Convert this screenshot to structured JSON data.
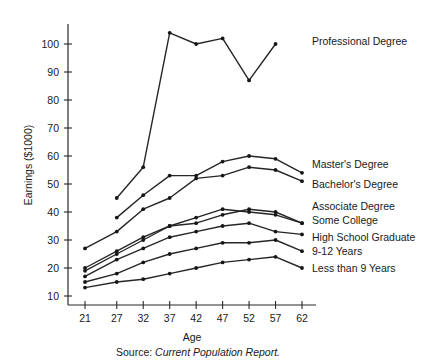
{
  "chart_data": {
    "type": "line",
    "title": "",
    "xlabel": "Age",
    "ylabel": "Earnings ($1000)",
    "x": [
      21,
      27,
      32,
      37,
      42,
      47,
      52,
      57,
      62
    ],
    "xticklabels": [
      "21",
      "27",
      "32",
      "37",
      "42",
      "47",
      "52",
      "57",
      "62"
    ],
    "yticklabels": [
      "10",
      "20",
      "30",
      "40",
      "50",
      "60",
      "70",
      "80",
      "90",
      "100"
    ],
    "yticks": [
      10,
      20,
      30,
      40,
      50,
      60,
      70,
      80,
      90,
      100
    ],
    "xlim": [
      21,
      62
    ],
    "ylim": [
      5,
      108
    ],
    "grid": false,
    "legend_position": "right-inline-at-series-end",
    "annotation": "Source: Current Population Report.",
    "annotation_prefix": "Source: ",
    "annotation_italic": "Current Population Report.",
    "series": [
      {
        "name": "Professional Degree",
        "x": [
          27,
          32,
          37,
          42,
          47,
          52,
          57
        ],
        "values": [
          45,
          56,
          104,
          100,
          102,
          87,
          100
        ],
        "label_x": 62,
        "label_y": 101
      },
      {
        "name": "Master's Degree",
        "x": [
          27,
          32,
          37,
          42,
          47,
          52,
          57,
          62
        ],
        "values": [
          38,
          46,
          53,
          53,
          58,
          60,
          59,
          54
        ],
        "label_x": 62,
        "label_y": 57
      },
      {
        "name": "Bachelor's Degree",
        "x": [
          21,
          27,
          32,
          37,
          42,
          47,
          52,
          57,
          62
        ],
        "values": [
          27,
          33,
          41,
          45,
          52,
          53,
          56,
          55,
          51
        ],
        "label_x": 62,
        "label_y": 50
      },
      {
        "name": "Associate Degree",
        "x": [
          21,
          27,
          32,
          37,
          42,
          47,
          52,
          57,
          62
        ],
        "values": [
          20,
          26,
          31,
          35,
          38,
          41,
          40,
          39,
          36
        ],
        "label_x": 62,
        "label_y": 42
      },
      {
        "name": "Some College",
        "x": [
          21,
          27,
          32,
          37,
          42,
          47,
          52,
          57,
          62
        ],
        "values": [
          19,
          25,
          30,
          35,
          36,
          39,
          41,
          40,
          36
        ],
        "label_x": 62,
        "label_y": 37
      },
      {
        "name": "High School Graduate",
        "x": [
          21,
          27,
          32,
          37,
          42,
          47,
          52,
          57,
          62
        ],
        "values": [
          17,
          23,
          27,
          31,
          33,
          35,
          36,
          33,
          32
        ],
        "label_x": 62,
        "label_y": 31
      },
      {
        "name": "9-12 Years",
        "x": [
          21,
          27,
          32,
          37,
          42,
          47,
          52,
          57,
          62
        ],
        "values": [
          15,
          18,
          22,
          25,
          27,
          29,
          29,
          30,
          26
        ],
        "label_x": 62,
        "label_y": 26
      },
      {
        "name": "Less than 9 Years",
        "x": [
          21,
          27,
          32,
          37,
          42,
          47,
          52,
          57,
          62
        ],
        "values": [
          13,
          15,
          16,
          18,
          20,
          22,
          23,
          24,
          20
        ],
        "label_x": 62,
        "label_y": 20
      }
    ]
  },
  "labels": {
    "y_axis_title": "Earnings ($1000)",
    "x_axis_title": "Age",
    "source_prefix": "Source: ",
    "source_italic": "Current Population Report."
  }
}
